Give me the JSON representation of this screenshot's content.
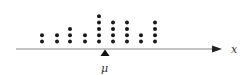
{
  "chart_data": {
    "type": "scatter",
    "subtype": "dot_plot",
    "title": "",
    "xlabel": "x",
    "ylabel": "",
    "columns": [
      {
        "x": 42,
        "count": 2
      },
      {
        "x": 57,
        "count": 2
      },
      {
        "x": 70,
        "count": 3
      },
      {
        "x": 85,
        "count": 2
      },
      {
        "x": 99,
        "count": 5
      },
      {
        "x": 113,
        "count": 4
      },
      {
        "x": 127,
        "count": 4
      },
      {
        "x": 141,
        "count": 2
      },
      {
        "x": 155,
        "count": 4
      }
    ],
    "counts": [
      2,
      2,
      3,
      2,
      5,
      4,
      4,
      2,
      4
    ],
    "annotations": [
      {
        "label": "μ",
        "marker": "triangle",
        "position_x": 105
      }
    ],
    "grid": false
  },
  "labels": {
    "axis_label": "x",
    "mean_label": "μ"
  },
  "colors": {
    "dot": "#1a1a1a",
    "axis": "#777777",
    "marker": "#111111"
  }
}
